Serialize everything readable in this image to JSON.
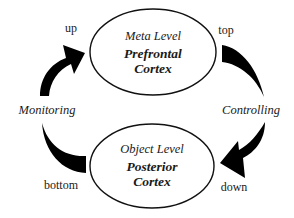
{
  "diagram": {
    "type": "cycle",
    "nodes": [
      {
        "id": "meta",
        "level_label": "Meta Level",
        "region_line1": "Prefrontal",
        "region_line2": "Cortex",
        "position": "top"
      },
      {
        "id": "object",
        "level_label": "Object Level",
        "region_line1": "Posterior",
        "region_line2": "Cortex",
        "position": "bottom"
      }
    ],
    "processes": {
      "left": "Monitoring",
      "right": "Controlling"
    },
    "directions": {
      "up": "up",
      "top": "top",
      "down": "down",
      "bottom": "bottom"
    },
    "edges": [
      {
        "from": "object",
        "to": "meta",
        "via": "Monitoring",
        "side": "left",
        "start_label": "bottom",
        "end_label": "up"
      },
      {
        "from": "meta",
        "to": "object",
        "via": "Controlling",
        "side": "right",
        "start_label": "top",
        "end_label": "down"
      }
    ],
    "colors": {
      "arrow": "#000000",
      "ellipse_stroke": "#111111",
      "text": "#1a1a1a",
      "background": "#ffffff"
    }
  }
}
